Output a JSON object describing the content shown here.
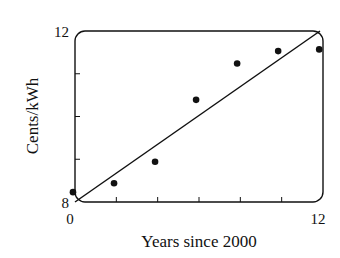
{
  "chart_data": {
    "type": "scatter",
    "title": "",
    "xlabel": "Years since 2000",
    "ylabel": "Cents/kWh",
    "xlim": [
      0,
      12
    ],
    "ylim": [
      8,
      12
    ],
    "x_tick_labels": [
      "0",
      "12"
    ],
    "y_tick_labels": [
      "8",
      "12"
    ],
    "x_ticks": [
      0,
      2,
      4,
      6,
      8,
      10,
      12
    ],
    "y_ticks": [
      8,
      9,
      10,
      11,
      12
    ],
    "grid": false,
    "legend": null,
    "series": [
      {
        "name": "data",
        "type": "scatter",
        "x": [
          0,
          2,
          4,
          6,
          8,
          10,
          12
        ],
        "y": [
          8.23,
          8.44,
          8.94,
          10.39,
          11.24,
          11.53,
          11.57
        ]
      },
      {
        "name": "fit line",
        "type": "line",
        "x": [
          0,
          12
        ],
        "y": [
          8.0,
          12.0
        ]
      }
    ]
  }
}
